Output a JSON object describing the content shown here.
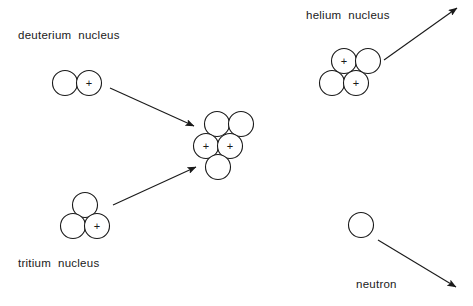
{
  "figure": {
    "background_color": "#ffffff",
    "stroke_color": "#1a1a1a",
    "text_color": "#1a1a1a",
    "width": 473,
    "height": 306
  },
  "labels": {
    "deuterium": "deuterium  nucleus",
    "tritium": "tritium  nucleus",
    "helium": "helium nucleus",
    "neutron": "neutron"
  },
  "charge_symbol": "+",
  "nuclei": [
    {
      "id": "deuterium",
      "label": "deuterium  nucleus",
      "label_x": 18,
      "label_y": 36,
      "particles": [
        {
          "type": "neutron",
          "cx": 65,
          "cy": 83,
          "r": 12.5,
          "charge": ""
        },
        {
          "type": "proton",
          "cx": 89,
          "cy": 83,
          "r": 12.5,
          "charge": "+"
        }
      ]
    },
    {
      "id": "tritium",
      "label": "tritium  nucleus",
      "label_x": 18,
      "label_y": 264,
      "particles": [
        {
          "type": "neutron",
          "cx": 85,
          "cy": 205,
          "r": 12.5,
          "charge": ""
        },
        {
          "type": "neutron",
          "cx": 73,
          "cy": 226,
          "r": 12.5,
          "charge": ""
        },
        {
          "type": "proton",
          "cx": 97,
          "cy": 226,
          "r": 12.5,
          "charge": "+"
        }
      ]
    },
    {
      "id": "compound",
      "label": "",
      "particles": [
        {
          "type": "neutron",
          "cx": 217,
          "cy": 124,
          "r": 12.5,
          "charge": ""
        },
        {
          "type": "neutron",
          "cx": 241,
          "cy": 124,
          "r": 12.5,
          "charge": ""
        },
        {
          "type": "proton",
          "cx": 206,
          "cy": 146,
          "r": 12.5,
          "charge": "+"
        },
        {
          "type": "proton",
          "cx": 230,
          "cy": 146,
          "r": 12.5,
          "charge": "+"
        },
        {
          "type": "neutron",
          "cx": 218,
          "cy": 167,
          "r": 12.5,
          "charge": ""
        }
      ]
    },
    {
      "id": "helium",
      "label": "helium nucleus",
      "label_x": 306,
      "label_y": 16,
      "particles": [
        {
          "type": "proton",
          "cx": 344,
          "cy": 61,
          "r": 12.5,
          "charge": "+"
        },
        {
          "type": "neutron",
          "cx": 368,
          "cy": 61,
          "r": 12.5,
          "charge": ""
        },
        {
          "type": "neutron",
          "cx": 332,
          "cy": 83,
          "r": 12.5,
          "charge": ""
        },
        {
          "type": "proton",
          "cx": 356,
          "cy": 83,
          "r": 12.5,
          "charge": "+"
        }
      ]
    },
    {
      "id": "neutron",
      "label": "neutron",
      "label_x": 356,
      "label_y": 285,
      "particles": [
        {
          "type": "neutron",
          "cx": 361,
          "cy": 225,
          "r": 12.5,
          "charge": ""
        }
      ]
    }
  ],
  "arrows": [
    {
      "id": "deuterium-to-compound",
      "x1": 110,
      "y1": 88,
      "x2": 194,
      "y2": 126
    },
    {
      "id": "tritium-to-compound",
      "x1": 113,
      "y1": 205,
      "x2": 196,
      "y2": 167
    },
    {
      "id": "helium-emitted",
      "x1": 384,
      "y1": 60,
      "x2": 457,
      "y2": 8
    },
    {
      "id": "neutron-emitted",
      "x1": 378,
      "y1": 240,
      "x2": 456,
      "y2": 287
    }
  ]
}
